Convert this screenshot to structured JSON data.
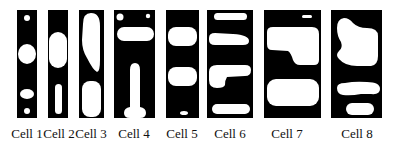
{
  "figure": {
    "panel_color": "#000000",
    "blob_color": "#ffffff",
    "cells": [
      {
        "label": "Cell 1"
      },
      {
        "label": "Cell 2"
      },
      {
        "label": "Cell 3"
      },
      {
        "label": "Cell 4"
      },
      {
        "label": "Cell 5"
      },
      {
        "label": "Cell 6"
      },
      {
        "label": "Cell 7"
      },
      {
        "label": "Cell 8"
      }
    ]
  }
}
